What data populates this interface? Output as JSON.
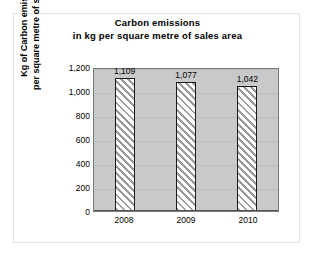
{
  "chart_data": {
    "type": "bar",
    "title": "Carbon emissions in kg per square metre of sales area",
    "title_lines": [
      "Carbon emissions",
      "in kg per square metre of sales area"
    ],
    "categories": [
      "2008",
      "2009",
      "2010"
    ],
    "values": [
      1109,
      1077,
      1042
    ],
    "data_labels": [
      "1,109",
      "1,077",
      "1,042"
    ],
    "xlabel": "",
    "ylabel": "Kg of Carbon emissions per square metre of sales area",
    "ylabel_lines": [
      "Kg of Carbon emissions",
      "per square metre of sales area"
    ],
    "ylim": [
      0,
      1200
    ],
    "ytick_values": [
      0,
      200,
      400,
      600,
      800,
      1000,
      1200
    ],
    "ytick_labels": [
      "0",
      "200",
      "400",
      "600",
      "800",
      "1,000",
      "1,200"
    ],
    "grid": true,
    "legend": false,
    "series": [
      {
        "name": "Carbon emissions",
        "values": [
          1109,
          1077,
          1042
        ],
        "fill": "diagonal-hatch",
        "border_color": "#1a1a1a"
      }
    ],
    "colors": {
      "plot_background": "#c9c9c9",
      "figure_background": "#ffffff",
      "gridline": "#bdbdbd",
      "axis": "#555555",
      "text": "#000000",
      "hatch": "#9a9a9a"
    }
  }
}
